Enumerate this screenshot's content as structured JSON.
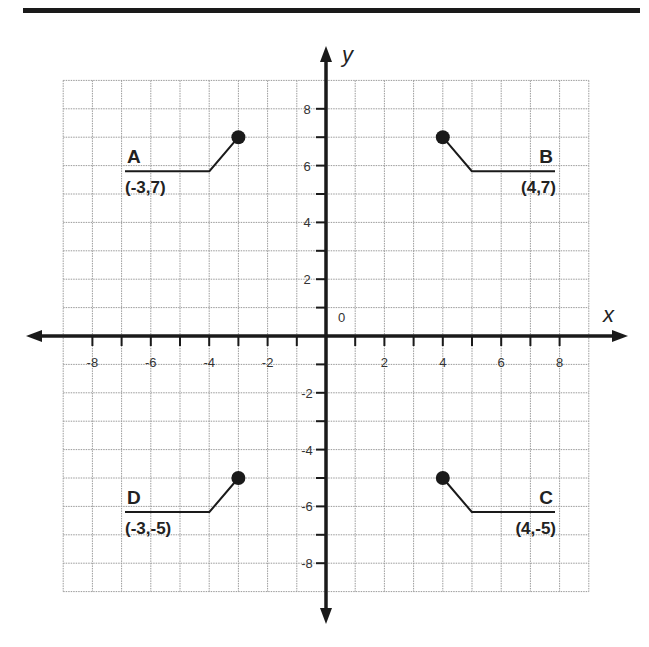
{
  "axes": {
    "x_label": "x",
    "y_label": "y",
    "origin_label": "0"
  },
  "grid": {
    "x_min": -9,
    "x_max": 9,
    "y_min": -9,
    "y_max": 9,
    "step": 1
  },
  "x_ticks": [
    "-8",
    "-6",
    "-4",
    "-2",
    "2",
    "4",
    "6",
    "8"
  ],
  "y_ticks": [
    "8",
    "6",
    "4",
    "2",
    "-2",
    "-4",
    "-6",
    "-8"
  ],
  "points": [
    {
      "name": "A",
      "coords": "(-3,7)",
      "x": -3,
      "y": 7
    },
    {
      "name": "B",
      "coords": "(4,7)",
      "x": 4,
      "y": 7
    },
    {
      "name": "C",
      "coords": "(4,-5)",
      "x": 4,
      "y": -5
    },
    {
      "name": "D",
      "coords": "(-3,-5)",
      "x": -3,
      "y": -5
    }
  ],
  "colors": {
    "axis": "#1a1a1a",
    "grid": "#9a9a9a",
    "point": "#1a1a1a"
  }
}
